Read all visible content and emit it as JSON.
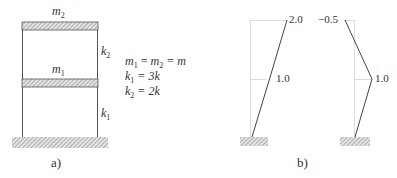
{
  "panel_a": {
    "caption": "a)",
    "masses": [
      {
        "symbol": "m",
        "sub": "2"
      },
      {
        "symbol": "m",
        "sub": "1"
      }
    ],
    "springs": [
      {
        "symbol": "k",
        "sub": "2"
      },
      {
        "symbol": "k",
        "sub": "1"
      }
    ],
    "equations": [
      {
        "lhs_a": "m",
        "sub_a": "1",
        "mid": " = ",
        "lhs_b": "m",
        "sub_b": "2",
        "rhs": " = m"
      },
      {
        "lhs_a": "k",
        "sub_a": "1",
        "rhs": " = 3k"
      },
      {
        "lhs_a": "k",
        "sub_a": "2",
        "rhs": " = 2k"
      }
    ]
  },
  "panel_b": {
    "caption": "b)",
    "mode_1": {
      "top_value": "2.0",
      "mid_value": "1.0"
    },
    "mode_2": {
      "top_value": "−0.5",
      "mid_value": "1.0"
    }
  },
  "colors": {
    "line": "#444444",
    "guide": "#d8d8d8",
    "hatch": "#9a9a9a",
    "text": "#333333"
  }
}
